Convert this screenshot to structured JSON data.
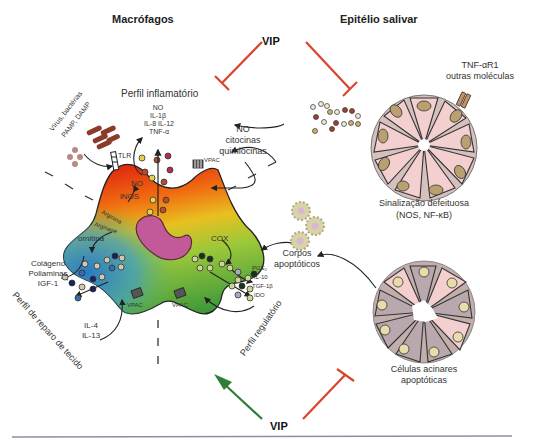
{
  "headers": {
    "macrophages": "Macrófagos",
    "salivary_epithelium": "Epitélio salivar"
  },
  "vip": {
    "top": "VIP",
    "bottom": "VIP"
  },
  "inflammatory": {
    "title": "Perfil inflamatório",
    "mediators": [
      "NO",
      "IL-1β",
      "IL-8  IL-12",
      "TNF-α"
    ],
    "pathogens": "Vírus, bactérias",
    "pamp_damp": "PAMP, DAMP",
    "tlr": "TLR",
    "no_cytokines": [
      "NO",
      "citocinas",
      "quimiocinas"
    ]
  },
  "macrophage": {
    "no": "NO",
    "inos": "iNOS",
    "arginine": "Arginina",
    "arginase": "Arginase",
    "ornithine": "ornitina",
    "cox": "COX",
    "vpac_labels": [
      "VPAC",
      "VPAC",
      "VPAC"
    ]
  },
  "tissue_repair": {
    "title": "Perfil de reparo de tecido",
    "products": [
      "Colágeno",
      "Poliaminas",
      "IGF-1"
    ],
    "inducers": [
      "IL-4",
      "IL-13"
    ]
  },
  "regulatory": {
    "title": "Perfil regulatório",
    "products": [
      "PGE₂",
      "IL-10",
      "TGF-1β",
      "IDO"
    ]
  },
  "epithelium": {
    "receptor": [
      "TNF-αR1",
      "outras moléculas"
    ],
    "defective_signaling": [
      "Sinalização defeituosa",
      "(NOS, NF-κB)"
    ],
    "apoptotic_bodies": [
      "Corpos",
      "apoptóticos"
    ],
    "apoptotic_cells": [
      "Células acinares",
      "apoptóticas"
    ]
  },
  "colors": {
    "inhibit_red": "#d9442b",
    "activate_green": "#2e7d3a",
    "cell_pink": "#f3cfd0",
    "nucleus_tan": "#b8a070",
    "apoptotic_gray": "#b9a9ae",
    "nucleus_magenta": "#c25a9a"
  }
}
